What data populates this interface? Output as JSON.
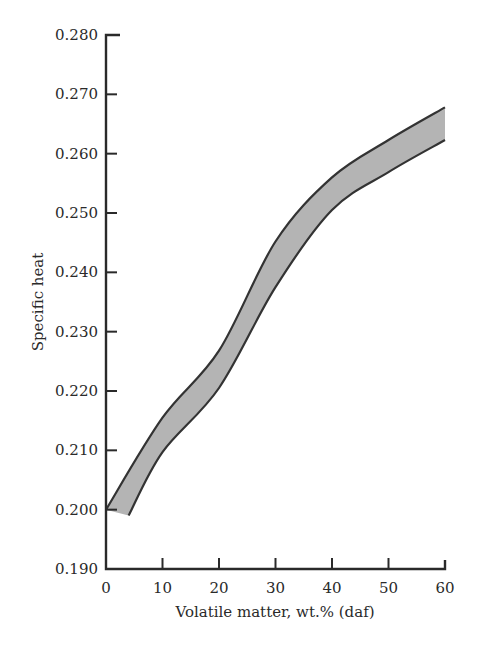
{
  "chart_data": {
    "type": "area",
    "title": "",
    "xlabel": "Volatile matter, wt.% (daf)",
    "ylabel": "Specific heat",
    "xlim": [
      0,
      60
    ],
    "ylim": [
      0.19,
      0.28
    ],
    "x_ticks": [
      "0",
      "10",
      "20",
      "30",
      "40",
      "50",
      "60"
    ],
    "y_ticks": [
      "0.190",
      "0.200",
      "0.210",
      "0.220",
      "0.230",
      "0.240",
      "0.250",
      "0.260",
      "0.270",
      "0.280"
    ],
    "grid": false,
    "legend": null,
    "band_color": "#b4b4b4",
    "edge_color": "#333333",
    "series": [
      {
        "name": "upper bound",
        "x": [
          0,
          10,
          20,
          30,
          40,
          50,
          60
        ],
        "values": [
          0.2,
          0.2155,
          0.2268,
          0.2452,
          0.256,
          0.2623,
          0.2678
        ]
      },
      {
        "name": "lower bound",
        "x": [
          4,
          10,
          20,
          30,
          40,
          50,
          60
        ],
        "values": [
          0.199,
          0.2097,
          0.2205,
          0.2375,
          0.2505,
          0.2569,
          0.2623
        ]
      }
    ]
  }
}
